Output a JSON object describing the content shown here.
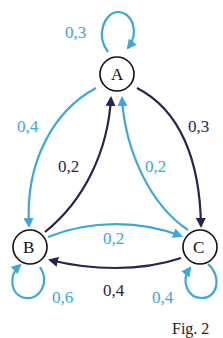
{
  "diagram": {
    "type": "markov-chain",
    "colors": {
      "light_edge": "#3aa8dc",
      "dark_edge": "#2a2350",
      "node_stroke": "#111111"
    },
    "nodes": [
      {
        "id": "A",
        "label": "A"
      },
      {
        "id": "B",
        "label": "B"
      },
      {
        "id": "C",
        "label": "C"
      }
    ],
    "edges": [
      {
        "from": "A",
        "to": "A",
        "label": "0,3",
        "color": "light"
      },
      {
        "from": "A",
        "to": "B",
        "label": "0,4",
        "color": "light"
      },
      {
        "from": "A",
        "to": "C",
        "label": "0,3",
        "color": "dark"
      },
      {
        "from": "B",
        "to": "A",
        "label": "0,2",
        "color": "dark"
      },
      {
        "from": "C",
        "to": "A",
        "label": "0,2",
        "color": "light"
      },
      {
        "from": "B",
        "to": "C",
        "label": "0,2",
        "color": "light"
      },
      {
        "from": "C",
        "to": "B",
        "label": "0,4",
        "color": "dark"
      },
      {
        "from": "B",
        "to": "B",
        "label": "0,6",
        "color": "light"
      },
      {
        "from": "C",
        "to": "C",
        "label": "0,4",
        "color": "light"
      }
    ],
    "caption": "Fig. 2"
  }
}
